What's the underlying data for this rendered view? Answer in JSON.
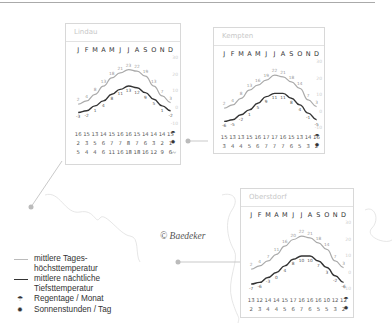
{
  "legend": {
    "high": "mittlere Tages-\nhöchsttemperatur",
    "high_l1": "mittlere Tages-",
    "high_l2": "höchsttemperatur",
    "low_l1": "mittlere nächtliche",
    "low_l2": "Tiefsttemperatur",
    "rain": "Regentage / Monat",
    "sun": "Sonnenstunden / Tag"
  },
  "copyright": "© Baedeker",
  "months": [
    "J",
    "F",
    "M",
    "A",
    "M",
    "J",
    "J",
    "A",
    "S",
    "O",
    "N",
    "D"
  ],
  "axis_ticks": [
    "30",
    "20",
    "10",
    "0",
    "-10"
  ],
  "colors": {
    "high_line": "#aaaaaa",
    "low_line": "#333333",
    "frame": "#d8d8d8"
  },
  "chart_data": [
    {
      "type": "line",
      "title": "Lindau",
      "categories": [
        "J",
        "F",
        "M",
        "A",
        "M",
        "J",
        "J",
        "A",
        "S",
        "O",
        "N",
        "D"
      ],
      "series": [
        {
          "name": "mittlere Tageshöchsttemperatur",
          "values": [
            2,
            4,
            8,
            13,
            18,
            21,
            23,
            22,
            19,
            13,
            7,
            3
          ]
        },
        {
          "name": "mittlere nächtliche Tiefsttemperatur",
          "values": [
            -3,
            -2,
            1,
            4,
            8,
            11,
            13,
            12,
            9,
            5,
            1,
            -2
          ]
        }
      ],
      "rows": {
        "rain_days": [
          16,
          15,
          13,
          14,
          15,
          16,
          16,
          15,
          14,
          14,
          14,
          15
        ],
        "sun_hours": [
          2,
          3,
          5,
          6,
          7,
          7,
          8,
          7,
          6,
          3,
          2,
          1
        ],
        "water_temp": [
          5,
          4,
          4,
          6,
          11,
          16,
          18,
          18,
          16,
          12,
          9,
          6
        ]
      },
      "ylim": [
        -10,
        30
      ]
    },
    {
      "type": "line",
      "title": "Kempten",
      "categories": [
        "J",
        "F",
        "M",
        "A",
        "M",
        "J",
        "J",
        "A",
        "S",
        "O",
        "N",
        "D"
      ],
      "series": [
        {
          "name": "mittlere Tageshöchsttemperatur",
          "values": [
            2,
            4,
            8,
            13,
            16,
            19,
            22,
            21,
            18,
            14,
            7,
            3
          ]
        },
        {
          "name": "mittlere nächtliche Tiefsttemperatur",
          "values": [
            -6,
            -5,
            -2,
            1,
            5,
            9,
            11,
            11,
            8,
            4,
            -1,
            -5
          ]
        }
      ],
      "rows": {
        "rain_days": [
          15,
          13,
          13,
          15,
          16,
          17,
          17,
          16,
          15,
          13,
          14,
          16
        ],
        "sun_hours": [
          3,
          4,
          4,
          5,
          6,
          7,
          7,
          7,
          6,
          5,
          3,
          2
        ]
      },
      "ylim": [
        -10,
        30
      ]
    },
    {
      "type": "line",
      "title": "Oberstdorf",
      "categories": [
        "J",
        "F",
        "M",
        "A",
        "M",
        "J",
        "J",
        "A",
        "S",
        "O",
        "N",
        "D"
      ],
      "series": [
        {
          "name": "mittlere Tageshöchsttemperatur",
          "values": [
            2,
            4,
            7,
            11,
            16,
            20,
            22,
            21,
            18,
            14,
            7,
            3
          ]
        },
        {
          "name": "mittlere nächtliche Tiefsttemperatur",
          "values": [
            -7,
            -6,
            -3,
            0,
            4,
            8,
            10,
            10,
            7,
            3,
            -2,
            -6
          ]
        }
      ],
      "rows": {
        "rain_days": [
          13,
          12,
          14,
          14,
          15,
          17,
          16,
          16,
          16,
          10,
          12,
          12
        ],
        "sun_hours": [
          2,
          3,
          4,
          4,
          5,
          6,
          7,
          6,
          5,
          5,
          3,
          2
        ]
      },
      "ylim": [
        -10,
        30
      ]
    }
  ]
}
